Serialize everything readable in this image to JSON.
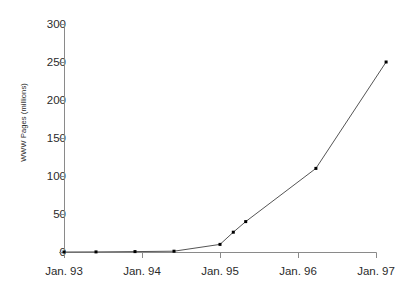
{
  "chart_data": {
    "type": "line",
    "title": "",
    "xlabel": "",
    "ylabel": "WWW Pages (millions)",
    "ylim": [
      0,
      300
    ],
    "yticks": [
      0,
      50,
      100,
      150,
      200,
      250,
      300
    ],
    "xticks": [
      "Jan. 93",
      "Jan. 94",
      "Jan. 95",
      "Jan. 96",
      "Jan. 97"
    ],
    "xlim": [
      "Jan. 93",
      "Jan. 97"
    ],
    "grid": false,
    "legend": null,
    "marker": "square",
    "line_color": "#555555",
    "marker_color": "#000000",
    "series": [
      {
        "name": "WWW Pages",
        "x": [
          "Jan. 93",
          "May 93",
          "Nov. 93",
          "Jun. 94",
          "Jan. 95",
          "Mar. 95",
          "May 95",
          "Apr. 96",
          "Feb. 97"
        ],
        "x_numeric": [
          0,
          0.41,
          0.91,
          1.41,
          2.0,
          2.17,
          2.33,
          3.23,
          4.13
        ],
        "values": [
          0,
          0.1,
          0.5,
          1,
          10,
          26,
          40,
          110,
          250
        ]
      }
    ]
  },
  "axis": {
    "y_title": "WWW Pages (millions)",
    "y_labels": [
      "300",
      "250",
      "200",
      "150",
      "100",
      "50",
      "0"
    ],
    "x_labels": [
      "Jan. 93",
      "Jan. 94",
      "Jan. 95",
      "Jan. 96",
      "Jan. 97"
    ]
  }
}
